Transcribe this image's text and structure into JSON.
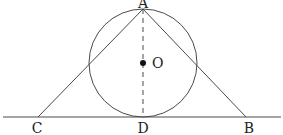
{
  "diagram": {
    "type": "geometry",
    "colors": {
      "stroke": "#4a4a4a",
      "text": "#222222",
      "background": "#ffffff"
    },
    "points": {
      "A": {
        "label": "A",
        "x": 143,
        "y": 9
      },
      "O": {
        "label": "O",
        "x": 143,
        "y": 63
      },
      "C": {
        "label": "C",
        "x": 38,
        "y": 117
      },
      "D": {
        "label": "D",
        "x": 143,
        "y": 117
      },
      "B": {
        "label": "B",
        "x": 246,
        "y": 117
      }
    },
    "circle": {
      "center": "O",
      "radius": 54
    },
    "segments": [
      {
        "from": "A",
        "to": "C",
        "style": "solid"
      },
      {
        "from": "A",
        "to": "B",
        "style": "solid"
      },
      {
        "from": "A",
        "to": "D",
        "style": "dashed"
      }
    ],
    "baseline": {
      "y": 117,
      "x_start": 3,
      "x_end": 281
    },
    "labels": {
      "A": "A",
      "O": "O",
      "C": "C",
      "D": "D",
      "B": "B"
    }
  }
}
